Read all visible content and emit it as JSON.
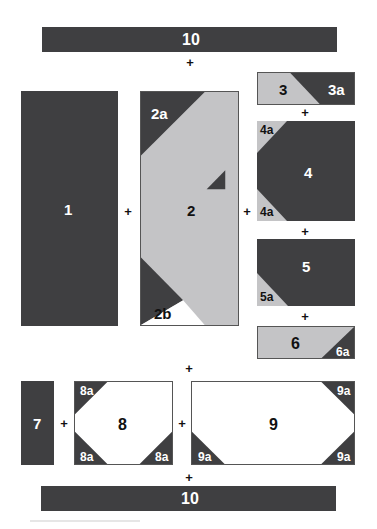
{
  "colors": {
    "dark": "#3f3f41",
    "light": "#c4c4c6",
    "white": "#ffffff",
    "outline": "#555555"
  },
  "join_symbol": "+",
  "pieces": {
    "p10_top": {
      "label": "10"
    },
    "p1": {
      "label": "1"
    },
    "p2": {
      "label": "2",
      "sub_a": "2a",
      "sub_b": "2b"
    },
    "p3": {
      "label": "3",
      "sub_a": "3a"
    },
    "p4": {
      "label": "4",
      "sub_a_top": "4a",
      "sub_a_bottom": "4a"
    },
    "p5": {
      "label": "5",
      "sub_a": "5a"
    },
    "p6": {
      "label": "6",
      "sub_a": "6a"
    },
    "p7": {
      "label": "7"
    },
    "p8": {
      "label": "8",
      "sub_top_left": "8a",
      "sub_bottom_left": "8a",
      "sub_bottom_right": "8a"
    },
    "p9": {
      "label": "9",
      "sub_top_right": "9a",
      "sub_bottom_left": "9a",
      "sub_bottom_right": "9a"
    },
    "p10_bottom": {
      "label": "10"
    }
  }
}
